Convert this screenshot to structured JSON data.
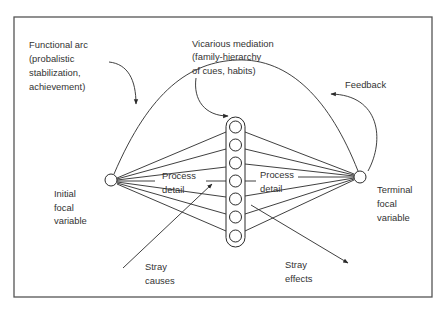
{
  "diagram": {
    "type": "lens-model",
    "labels": {
      "functional_arc": [
        "Functional arc",
        "(probalistic",
        "stabilization,",
        "achievement)"
      ],
      "vicarious_mediation": [
        "Vicarious mediation",
        "(family-hierarchy",
        "of cues, habits)"
      ],
      "feedback": [
        "Feedback"
      ],
      "initial_focal_variable": [
        "Initial",
        "focal",
        "variable"
      ],
      "terminal_focal_variable": [
        "Terminal",
        "focal",
        "variable"
      ],
      "process_detail_left": [
        "Process",
        "detail"
      ],
      "process_detail_right": [
        "Process",
        "detail"
      ],
      "stray_causes": [
        "Stray",
        "causes"
      ],
      "stray_effects": [
        "Stray",
        "effects"
      ]
    },
    "nodes": {
      "initial": {
        "cx": 111,
        "cy": 180,
        "r": 6
      },
      "terminal": {
        "cx": 360,
        "cy": 177,
        "r": 6
      },
      "mediator_count": 7
    },
    "colors": {
      "stroke": "#2a2a2a",
      "text": "#333333",
      "frame": "#555555",
      "background": "#ffffff"
    }
  }
}
